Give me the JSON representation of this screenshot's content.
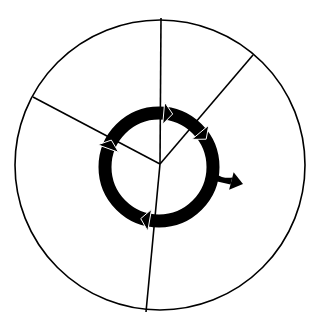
{
  "diagram": {
    "title": "",
    "type": "cycle-wheel",
    "colors": {
      "background": "#ffffff",
      "stroke": "#000000",
      "ring": "#000000",
      "arrowhead_outline": "#ffffff"
    },
    "outer_circle": {
      "cx": 160,
      "cy": 165,
      "r": 145
    },
    "hub": {
      "x": 160,
      "y": 164
    },
    "segments": [
      {
        "name": "segment-top",
        "angle_deg": -90,
        "end": [
          161,
          18
        ]
      },
      {
        "name": "segment-upper-right",
        "angle_deg": -47,
        "end": [
          253,
          55
        ]
      },
      {
        "name": "segment-bottom",
        "angle_deg": 95,
        "end": [
          146,
          312
        ]
      },
      {
        "name": "segment-left",
        "angle_deg": -157,
        "end": [
          33,
          97
        ]
      }
    ],
    "cycle_ring": {
      "cx": 159,
      "cy": 167,
      "r": 54,
      "thickness": 13,
      "direction": "clockwise",
      "arrowheads_at_deg": [
        -85,
        -40,
        100,
        -160
      ],
      "exit_arrow": {
        "from_deg": 10,
        "tip": [
          243,
          184
        ]
      }
    },
    "labels": []
  }
}
